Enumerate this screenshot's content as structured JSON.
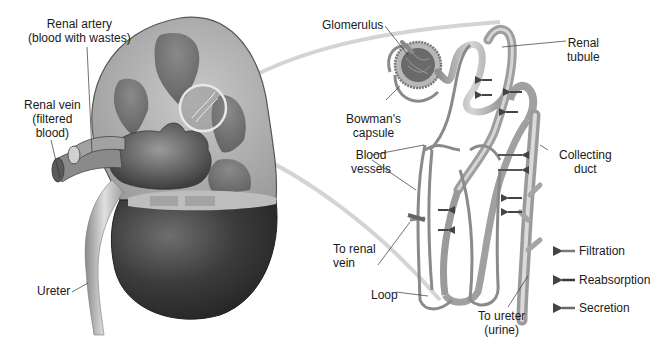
{
  "diagram": {
    "kidney_labels": {
      "renal_artery": "Renal artery\n(blood with wastes)",
      "renal_vein": "Renal vein\n(filtered\nblood)",
      "ureter": "Ureter"
    },
    "nephron_labels": {
      "glomerulus": "Glomerulus",
      "bowmans_capsule": "Bowman's\ncapsule",
      "renal_tubule": "Renal\ntubule",
      "blood_vessels": "Blood\nvessels",
      "collecting_duct": "Collecting\nduct",
      "to_renal_vein": "To renal\nvein",
      "loop": "Loop",
      "to_ureter": "To ureter\n(urine)"
    },
    "legend": [
      {
        "label": "Filtration",
        "arrow_color": "#7a7a7a"
      },
      {
        "label": "Reabsorption",
        "arrow_color": "#3a3a3a"
      },
      {
        "label": "Secretion",
        "arrow_color": "#6a6a6a"
      }
    ]
  }
}
